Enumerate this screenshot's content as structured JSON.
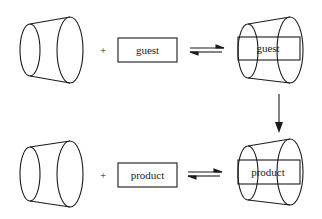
{
  "diagram": {
    "type": "host-guest equilibrium schematic",
    "stroke_color": "#1a1a1a",
    "background": "#ffffff",
    "rows": [
      {
        "host": "empty-truncated-cone-host",
        "operator": "+",
        "guest_label": "guest",
        "equilibrium": "reversible",
        "complex_label": "guest"
      },
      {
        "host": "empty-truncated-cone-host",
        "operator": "+",
        "guest_label": "product",
        "equilibrium": "reversible",
        "complex_label": "product"
      }
    ],
    "transition": "down-arrow from guest complex to product complex"
  }
}
